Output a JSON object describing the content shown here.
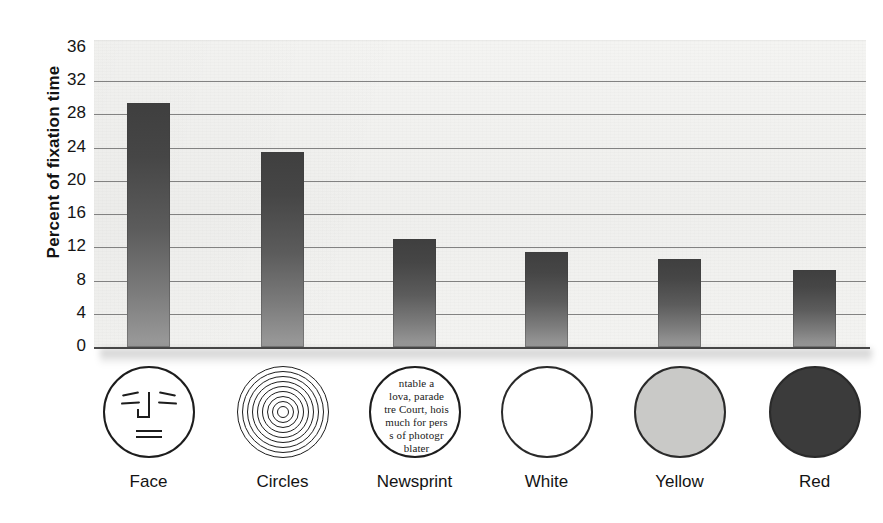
{
  "chart_data": {
    "type": "bar",
    "title": "",
    "xlabel": "",
    "ylabel": "Percent of fixation time",
    "ylim": [
      0,
      36
    ],
    "ytick_step": 4,
    "yticks": [
      36,
      32,
      28,
      24,
      20,
      16,
      12,
      8,
      4,
      0
    ],
    "gridlines": [
      32,
      28,
      24,
      20,
      16,
      12,
      8,
      4,
      0
    ],
    "grid": true,
    "legend": "none",
    "categories": [
      "Face",
      "Circles",
      "Newsprint",
      "White",
      "Yellow",
      "Red"
    ],
    "values": [
      29.4,
      23.5,
      13.0,
      11.4,
      10.6,
      9.3
    ],
    "series": [
      {
        "name": "Percent of fixation time",
        "values": [
          29.4,
          23.5,
          13.0,
          11.4,
          10.6,
          9.3
        ]
      }
    ],
    "bar_fill": "#555555",
    "bar_gradient_top": "#3f3f3f",
    "bar_gradient_bottom": "#9b9b9b",
    "plot_background": "#f2f2f0",
    "gridline_color": "#6e6e6e",
    "axis_color": "#4b4b4b",
    "text_color": "#131313"
  },
  "axis": {
    "y_title": "Percent of fixation time",
    "tick_labels": [
      "36",
      "32",
      "28",
      "24",
      "20",
      "16",
      "12",
      "8",
      "4",
      "0"
    ]
  },
  "stimuli": [
    {
      "name": "Face",
      "label": "Face",
      "icon": "face-icon",
      "fill": "#ffffff"
    },
    {
      "name": "Circles",
      "label": "Circles",
      "icon": "concentric-circles-icon",
      "ring_count": 9,
      "fill": "#ffffff"
    },
    {
      "name": "Newsprint",
      "label": "Newsprint",
      "icon": "newsprint-icon",
      "fill": "#ffffff",
      "text_lines": [
        "ntable a",
        "lova, parade",
        "tre Court, hois",
        "much for pers",
        "s of photogr",
        "blater"
      ]
    },
    {
      "name": "White",
      "label": "White",
      "icon": "white-disk-icon",
      "fill": "#ffffff"
    },
    {
      "name": "Yellow",
      "label": "Yellow",
      "icon": "yellow-disk-icon",
      "fill": "#c9c9c7"
    },
    {
      "name": "Red",
      "label": "Red",
      "icon": "red-disk-icon",
      "fill": "#3b3b3b"
    }
  ]
}
